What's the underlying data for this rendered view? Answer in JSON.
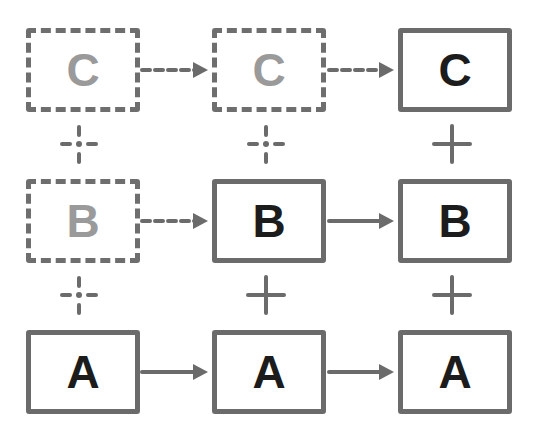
{
  "diagram": {
    "colors": {
      "line": "#6b6b6b",
      "label_solid": "#1c1c1c",
      "label_ghost": "#9a9a9a",
      "background": "#ffffff"
    },
    "columns": [
      {
        "index": 0,
        "boxes": {
          "C": {
            "label": "C",
            "style": "dashed"
          },
          "B": {
            "label": "B",
            "style": "dashed"
          },
          "A": {
            "label": "A",
            "style": "solid"
          }
        }
      },
      {
        "index": 1,
        "boxes": {
          "C": {
            "label": "C",
            "style": "dashed"
          },
          "B": {
            "label": "B",
            "style": "solid"
          },
          "A": {
            "label": "A",
            "style": "solid"
          }
        }
      },
      {
        "index": 2,
        "boxes": {
          "C": {
            "label": "C",
            "style": "solid"
          },
          "B": {
            "label": "B",
            "style": "solid"
          },
          "A": {
            "label": "A",
            "style": "solid"
          }
        }
      }
    ],
    "arrows": [
      {
        "row": "C",
        "from_col": 0,
        "to_col": 1,
        "style": "dashed"
      },
      {
        "row": "C",
        "from_col": 1,
        "to_col": 2,
        "style": "dashed"
      },
      {
        "row": "B",
        "from_col": 0,
        "to_col": 1,
        "style": "dashed"
      },
      {
        "row": "B",
        "from_col": 1,
        "to_col": 2,
        "style": "solid"
      },
      {
        "row": "A",
        "from_col": 0,
        "to_col": 1,
        "style": "solid"
      },
      {
        "row": "A",
        "from_col": 1,
        "to_col": 2,
        "style": "solid"
      }
    ],
    "plus_connectors": [
      {
        "between": "C-B",
        "col": 0,
        "style": "dashed"
      },
      {
        "between": "C-B",
        "col": 1,
        "style": "dashed"
      },
      {
        "between": "C-B",
        "col": 2,
        "style": "solid"
      },
      {
        "between": "B-A",
        "col": 0,
        "style": "dashed"
      },
      {
        "between": "B-A",
        "col": 1,
        "style": "solid"
      },
      {
        "between": "B-A",
        "col": 2,
        "style": "solid"
      }
    ]
  }
}
